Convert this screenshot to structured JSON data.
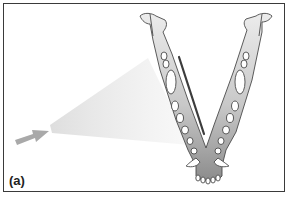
{
  "figure": {
    "panel_label": "(a)",
    "elements": [
      "x-ray-beam-cone",
      "beam-direction-arrow",
      "mandible",
      "film-sensor-line"
    ]
  },
  "colors": {
    "frame": "#3a3a3a",
    "bone_light": "#e6e6e6",
    "bone_dark": "#8f8f8f",
    "outline": "#4a4a4a",
    "beam": "#e2e2e2",
    "arrow": "#a9a9a9",
    "film": "#3c3c3c"
  }
}
